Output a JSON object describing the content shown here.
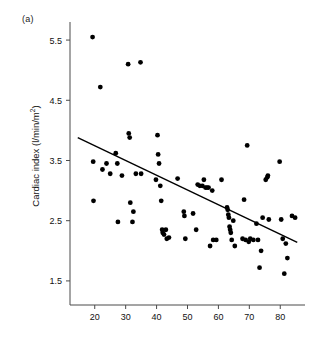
{
  "figure": {
    "panel_label": "(a)",
    "ylabel_text": "Cardiac index (l/min/m",
    "ylabel_sup": "2",
    "ylabel_close": ")"
  },
  "chart_data": {
    "type": "scatter",
    "title": "",
    "xlabel": "",
    "ylabel": "Cardiac index (l/min/m2)",
    "xlim": [
      12,
      88
    ],
    "ylim": [
      1.1,
      5.8
    ],
    "grid": false,
    "legend": null,
    "xticks": [
      20,
      30,
      40,
      50,
      60,
      70,
      80
    ],
    "yticks": [
      1.5,
      2.5,
      3.5,
      4.5,
      5.5
    ],
    "xtick_labels": [
      "20",
      "30",
      "40",
      "50",
      "60",
      "70",
      "80"
    ],
    "ytick_labels": [
      "1.5",
      "2.5",
      "3.5",
      "4.5",
      "5.5"
    ],
    "series": [
      {
        "name": "observations",
        "marker": "filled-circle",
        "color": "#000000",
        "x": [
          19.3,
          19.5,
          19.6,
          21.8,
          22.5,
          23.8,
          25.0,
          26.8,
          27.3,
          27.5,
          28.8,
          30.8,
          31.0,
          31.3,
          31.5,
          32.2,
          32.5,
          33.3,
          34.8,
          35.0,
          39.8,
          40.3,
          40.5,
          40.8,
          41.2,
          41.5,
          41.8,
          42.0,
          42.4,
          43.0,
          43.3,
          44.0,
          46.8,
          48.8,
          49.0,
          49.3,
          51.8,
          52.8,
          53.3,
          54.0,
          54.8,
          55.3,
          55.8,
          56.3,
          56.8,
          57.3,
          58.0,
          58.3,
          59.3,
          61.0,
          62.8,
          63.0,
          63.2,
          63.4,
          63.6,
          63.8,
          64.0,
          64.3,
          64.8,
          65.3,
          67.8,
          68.3,
          68.8,
          69.3,
          69.8,
          70.3,
          71.3,
          72.3,
          72.8,
          73.3,
          73.8,
          74.3,
          75.3,
          75.8,
          76.0,
          76.3,
          79.8,
          80.3,
          80.8,
          81.3,
          81.8,
          82.3,
          83.8,
          84.8
        ],
        "y": [
          5.55,
          3.48,
          2.83,
          4.72,
          3.35,
          3.45,
          3.28,
          3.62,
          3.45,
          2.48,
          3.25,
          5.1,
          3.95,
          3.88,
          2.8,
          2.48,
          2.65,
          3.28,
          5.13,
          3.28,
          3.18,
          3.92,
          3.6,
          3.45,
          3.08,
          2.83,
          2.35,
          2.3,
          2.27,
          2.35,
          2.2,
          2.22,
          3.2,
          2.65,
          2.58,
          2.2,
          2.62,
          2.35,
          3.1,
          3.08,
          3.08,
          3.18,
          3.05,
          3.05,
          3.05,
          2.08,
          3.0,
          2.18,
          2.18,
          3.18,
          2.72,
          2.68,
          2.6,
          2.55,
          2.4,
          2.35,
          2.3,
          2.18,
          2.5,
          2.08,
          2.2,
          2.85,
          2.18,
          3.75,
          2.15,
          2.2,
          2.18,
          2.45,
          2.18,
          1.72,
          2.0,
          2.55,
          3.18,
          3.22,
          3.25,
          2.52,
          3.48,
          2.52,
          2.2,
          1.62,
          2.12,
          1.88,
          2.58,
          2.55
        ]
      }
    ],
    "regression_line": {
      "x": [
        14.5,
        85.5
      ],
      "y": [
        3.88,
        2.14
      ],
      "color": "#000000"
    }
  }
}
